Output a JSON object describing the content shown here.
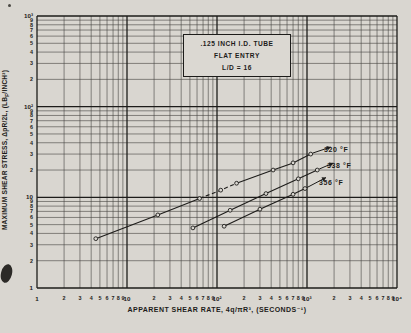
{
  "figure": {
    "paper_color": "#d9d6d0",
    "ink_color": "#1d1c1a",
    "minor_line_color": "#45433f",
    "inset_box": {
      "line1": ".125 INCH I.D. TUBE",
      "line2": "FLAT ENTRY",
      "line3": "L/D = 16"
    },
    "x_axis": {
      "title": "APPARENT SHEAR RATE, 4q/πR³, (SECONDS⁻¹)",
      "decade_labels": [
        "1",
        "10",
        "10²",
        "10³",
        "10⁴"
      ],
      "minor_labels": [
        "2",
        "3",
        "4",
        "5",
        "6",
        "7",
        "8",
        "9"
      ]
    },
    "y_axis": {
      "title_pre": "MAXIMUM SHEAR STRESS, ΔpR/2L, (LB",
      "title_sub": "F",
      "title_post": "/INCH²)",
      "decade_labels": [
        "1",
        "10",
        "10²",
        "10³"
      ],
      "minor_labels": [
        "2",
        "3",
        "4",
        "5",
        "6",
        "7",
        "8",
        "9"
      ]
    }
  },
  "chart_data": {
    "type": "line",
    "x_scale": "log",
    "y_scale": "log",
    "xlabel": "APPARENT SHEAR RATE, 4q/πR³, (SECONDS⁻¹)",
    "ylabel": "MAXIMUM SHEAR STRESS, ΔpR/2L, (LBF/INCH²)",
    "xlim": [
      1,
      10000
    ],
    "ylim": [
      1,
      1000
    ],
    "grid": "log-log, minor and major decade lines on",
    "legend_position": "arrow labels at right ends of curves",
    "annotation_box": ".125 INCH I.D. TUBE / FLAT ENTRY / L/D = 16",
    "series": [
      {
        "name": "320 °F",
        "points": [
          [
            4.5,
            3.5
          ],
          [
            22,
            6.4
          ],
          [
            64,
            9.7
          ],
          [
            110,
            12
          ],
          [
            165,
            14.3
          ],
          [
            420,
            20
          ],
          [
            700,
            24
          ],
          [
            1100,
            30
          ]
        ],
        "dashed_span": [
          2,
          4
        ]
      },
      {
        "name": "338 °F",
        "points": [
          [
            54,
            4.6
          ],
          [
            140,
            7.2
          ],
          [
            350,
            11
          ],
          [
            800,
            16
          ],
          [
            1300,
            20
          ]
        ],
        "dashed_span": null
      },
      {
        "name": "356 °F",
        "points": [
          [
            120,
            4.8
          ],
          [
            300,
            7.4
          ],
          [
            700,
            10.8
          ],
          [
            950,
            12.5
          ]
        ],
        "dashed_span": null
      }
    ]
  }
}
